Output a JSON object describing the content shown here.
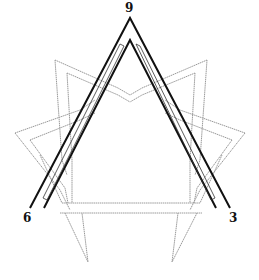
{
  "diagram": {
    "type": "enneagram-triangle",
    "labels": {
      "top": "9",
      "bottom_left": "6",
      "bottom_right": "3"
    },
    "colors": {
      "background": "#ffffff",
      "triangle_stroke": "#111111",
      "star_stroke": "#9a9a9a",
      "label": "#111111"
    },
    "points": {
      "9": [
        130,
        18
      ],
      "6": [
        30,
        208
      ],
      "3": [
        230,
        208
      ]
    }
  }
}
